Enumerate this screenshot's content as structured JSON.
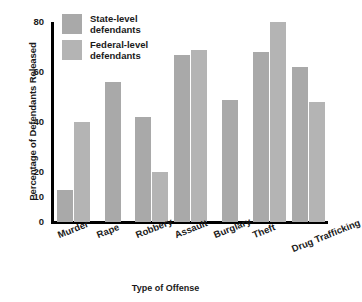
{
  "chart_data": {
    "type": "bar",
    "title": "",
    "xlabel": "Type of Offense",
    "ylabel": "Percentage of Defendants Released",
    "categories": [
      "Murder",
      "Rape",
      "Robbery",
      "Assault",
      "Burglary",
      "Theft",
      "Drug Trafficking"
    ],
    "series": [
      {
        "name": "State-level defendants",
        "color": "#a9a9a9",
        "values": [
          13,
          56,
          42,
          67,
          49,
          68,
          62
        ]
      },
      {
        "name": "Federal-level defendants",
        "color": "#b4b4b4",
        "values": [
          40,
          null,
          20,
          69,
          null,
          80,
          48
        ]
      }
    ],
    "ylim": [
      0,
      80
    ],
    "yticks": [
      0,
      10,
      20,
      40,
      60,
      80
    ],
    "ytick_labels": [
      "0",
      "10",
      "20",
      "40",
      "60",
      "80"
    ],
    "grid": false,
    "legend_position": "top-left",
    "xtick_rotation": -22
  },
  "axes": {
    "y_title": "Percentage of Defendants Released",
    "x_title": "Type of Offense",
    "axis_color": "#000000",
    "background": "#ffffff"
  },
  "legend": {
    "entries": [
      {
        "label": "State-level\ndefendants",
        "swatch": "#a9a9a9",
        "key": "state"
      },
      {
        "label": "Federal-level\ndefendants",
        "swatch": "#b4b4b4",
        "key": "federal"
      }
    ]
  }
}
